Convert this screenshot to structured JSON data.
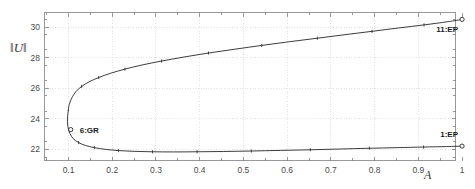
{
  "chart_data": {
    "type": "line",
    "title": "",
    "xlabel": "A",
    "ylabel": "‖U‖",
    "xlim": [
      0.045,
      0.985
    ],
    "ylim": [
      21.28,
      30.95
    ],
    "grid": true,
    "legend": null,
    "xticks": [
      0.1,
      0.2,
      0.3,
      0.4,
      0.5,
      0.6,
      0.7,
      0.8,
      0.9,
      1
    ],
    "xtick_labels": [
      "0.1",
      "0.2",
      "0.3",
      "0.4",
      "0.5",
      "0.6",
      "0.7",
      "0.8",
      "0.9",
      "1"
    ],
    "yticks": [
      22,
      24,
      26,
      28,
      30
    ],
    "ytick_labels": [
      "22",
      "24",
      "26",
      "28",
      "30"
    ],
    "minor_xticks": [
      0.05,
      0.15,
      0.25,
      0.35,
      0.45,
      0.55,
      0.65,
      0.75,
      0.85,
      0.95
    ],
    "minor_yticks": [
      21.5,
      22.5,
      23.5,
      24.5,
      25.5,
      26.5,
      27.5,
      28.5,
      29.5,
      30.5
    ],
    "series": [
      {
        "name": "upper-branch",
        "x": [
          0.0995,
          0.1005,
          0.1035,
          0.109,
          0.1175,
          0.13,
          0.147,
          0.169,
          0.196,
          0.229,
          0.268,
          0.313,
          0.364,
          0.42,
          0.48,
          0.542,
          0.605,
          0.669,
          0.732,
          0.794,
          0.855,
          0.913,
          0.968,
          1.0
        ],
        "y": [
          24.55,
          24.8,
          25.1,
          25.45,
          25.8,
          26.12,
          26.42,
          26.7,
          26.98,
          27.25,
          27.52,
          27.78,
          28.04,
          28.3,
          28.55,
          28.8,
          29.04,
          29.27,
          29.5,
          29.72,
          29.94,
          30.14,
          30.35,
          30.5
        ],
        "marker_x": [
          0.13,
          0.169,
          0.229,
          0.313,
          0.42,
          0.542,
          0.669,
          0.794,
          0.913,
          1.0
        ],
        "marker_y": [
          26.12,
          26.7,
          27.25,
          27.78,
          28.3,
          28.8,
          29.27,
          29.72,
          30.14,
          30.5
        ]
      },
      {
        "name": "lower-branch",
        "x": [
          0.0995,
          0.0975,
          0.0985,
          0.103,
          0.111,
          0.123,
          0.139,
          0.159,
          0.184,
          0.214,
          0.25,
          0.292,
          0.34,
          0.394,
          0.454,
          0.518,
          0.585,
          0.653,
          0.721,
          0.788,
          0.852,
          0.912,
          0.965,
          1.0
        ],
        "y": [
          24.55,
          24.0,
          23.5,
          23.05,
          22.7,
          22.45,
          22.26,
          22.12,
          22.01,
          21.93,
          21.88,
          21.85,
          21.84,
          21.85,
          21.87,
          21.9,
          21.94,
          21.98,
          22.03,
          22.08,
          22.12,
          22.16,
          22.19,
          22.22
        ],
        "marker_x": [
          0.123,
          0.159,
          0.214,
          0.292,
          0.394,
          0.518,
          0.653,
          0.788,
          0.912,
          1.0
        ],
        "marker_y": [
          22.45,
          22.12,
          21.93,
          21.85,
          21.85,
          21.9,
          21.98,
          22.08,
          22.16,
          22.22
        ]
      }
    ],
    "special_points": [
      {
        "id": "gr-point",
        "label": "6:GR",
        "x": 0.105,
        "y": 23.3,
        "label_dx": 9,
        "label_dy": -4
      },
      {
        "id": "ep-upper-point",
        "label": "11:EP",
        "x": 1.0,
        "y": 30.5,
        "label_dx": -4,
        "label_dy": 6
      },
      {
        "id": "ep-lower-point",
        "label": "1:EP",
        "x": 1.0,
        "y": 22.22,
        "label_dx": -4,
        "label_dy": -16
      }
    ],
    "colors": {
      "curve": "#1a1a1a",
      "frame": "#808080",
      "grid": "#d8d8d8",
      "tick_text": "#4a4a4a",
      "label_text": "#1a1a1a",
      "background": "#ffffff"
    }
  }
}
